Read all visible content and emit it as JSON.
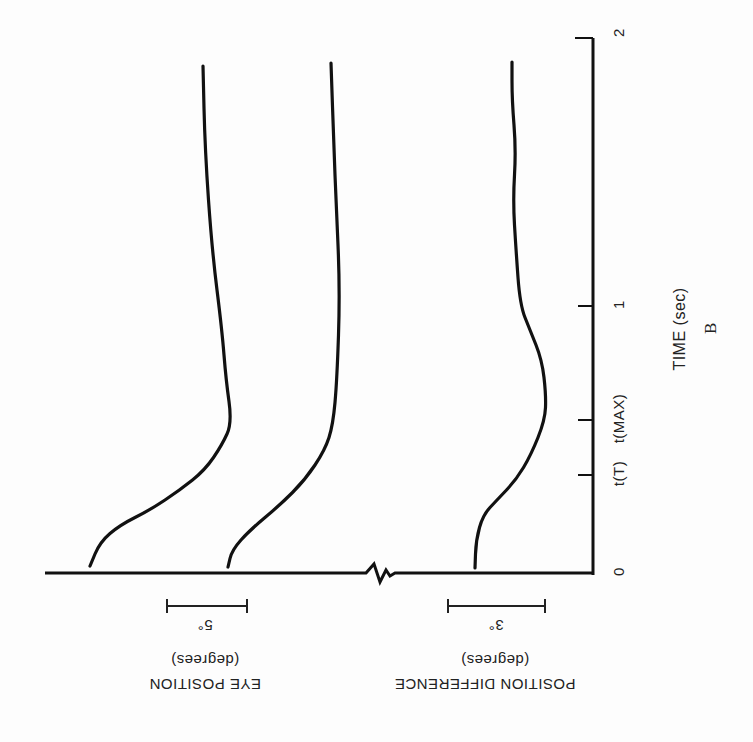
{
  "chart_data": {
    "type": "line",
    "panel_label": "B",
    "orientation_note": "figure is printed rotated: time axis runs vertically on right, traces drawn as near-vertical curves; left labels upside-down",
    "x_axis": {
      "label": "TIME (sec)",
      "range": [
        0,
        2
      ],
      "ticks": [
        {
          "value": 0,
          "label": "0"
        },
        {
          "value": 0.37,
          "label": "t(T)"
        },
        {
          "value": 0.57,
          "label": "t(MAX)"
        },
        {
          "value": 1,
          "label": "1"
        },
        {
          "value": 2,
          "label": "2"
        }
      ]
    },
    "y_axes": [
      {
        "label": "EYE POSITION",
        "unit": "(degrees)",
        "scale_bar": "5°"
      },
      {
        "label": "POSITION DIFFERENCE",
        "unit": "(degrees)",
        "scale_bar": "3°"
      }
    ],
    "axis_break": true,
    "series": [
      {
        "name": "Eye position trace 1",
        "group": "EYE POSITION",
        "points_t_deg": [
          [
            0.03,
            0.0
          ],
          [
            0.12,
            0.9
          ],
          [
            0.18,
            2.5
          ],
          [
            0.3,
            5.6
          ],
          [
            0.39,
            7.2
          ],
          [
            0.48,
            8.3
          ],
          [
            0.56,
            8.9
          ],
          [
            0.9,
            7.8
          ],
          [
            1.2,
            6.7
          ],
          [
            1.6,
            6.0
          ],
          [
            1.89,
            7.0
          ]
        ]
      },
      {
        "name": "Eye position trace 2",
        "group": "EYE POSITION",
        "points_t_deg": [
          [
            0.02,
            0.0
          ],
          [
            0.09,
            0.3
          ],
          [
            0.16,
            1.4
          ],
          [
            0.25,
            3.3
          ],
          [
            0.35,
            4.8
          ],
          [
            0.46,
            6.1
          ],
          [
            0.55,
            6.6
          ],
          [
            0.8,
            6.8
          ],
          [
            1.1,
            6.9
          ],
          [
            1.5,
            6.7
          ],
          [
            1.9,
            6.4
          ]
        ]
      },
      {
        "name": "Position difference",
        "group": "POSITION DIFFERENCE",
        "points_t_deg": [
          [
            0.02,
            0.0
          ],
          [
            0.12,
            0.1
          ],
          [
            0.22,
            0.6
          ],
          [
            0.32,
            1.3
          ],
          [
            0.42,
            2.0
          ],
          [
            0.55,
            2.2
          ],
          [
            0.66,
            2.2
          ],
          [
            0.8,
            1.9
          ],
          [
            0.96,
            1.4
          ],
          [
            1.2,
            1.3
          ],
          [
            1.5,
            1.3
          ],
          [
            1.9,
            1.2
          ]
        ]
      }
    ]
  },
  "render": {
    "axis": {
      "x": 593,
      "y_top": 38,
      "y_bottom": 573,
      "h_left": 45
    },
    "ticks_y": [
      38,
      475,
      420,
      306
    ],
    "traces_px": [
      [
        [
          90,
          566
        ],
        [
          100,
          542
        ],
        [
          120,
          525
        ],
        [
          150,
          510
        ],
        [
          180,
          490
        ],
        [
          205,
          470
        ],
        [
          222,
          445
        ],
        [
          232,
          423
        ],
        [
          226,
          380
        ],
        [
          222,
          330
        ],
        [
          212,
          250
        ],
        [
          205,
          150
        ],
        [
          203,
          66
        ]
      ],
      [
        [
          228,
          567
        ],
        [
          232,
          550
        ],
        [
          250,
          530
        ],
        [
          280,
          505
        ],
        [
          305,
          480
        ],
        [
          325,
          450
        ],
        [
          333,
          425
        ],
        [
          337,
          380
        ],
        [
          340,
          290
        ],
        [
          336,
          200
        ],
        [
          334,
          150
        ],
        [
          331,
          63
        ]
      ],
      [
        [
          475,
          568
        ],
        [
          476,
          540
        ],
        [
          483,
          515
        ],
        [
          497,
          500
        ],
        [
          516,
          480
        ],
        [
          531,
          455
        ],
        [
          545,
          420
        ],
        [
          546,
          395
        ],
        [
          542,
          360
        ],
        [
          530,
          330
        ],
        [
          520,
          305
        ],
        [
          516,
          250
        ],
        [
          513,
          200
        ],
        [
          516,
          150
        ],
        [
          512,
          100
        ],
        [
          512,
          62
        ]
      ]
    ],
    "scalebars": [
      {
        "x1": 167,
        "x2": 247,
        "y": 606,
        "label": "5°",
        "label_x": 205
      },
      {
        "x1": 448,
        "x2": 545,
        "y": 606,
        "label": "3°",
        "label_x": 496
      }
    ]
  },
  "labels": {
    "tick_0": "0",
    "tick_tT": "t(T)",
    "tick_tMAX": "t(MAX)",
    "tick_1": "1",
    "tick_2": "2",
    "time_axis_title": "TIME (sec)",
    "panel_letter": "B",
    "eye_scale": "5°",
    "diff_scale": "3°",
    "eye_unit": "(degrees)",
    "eye_title": "EYE POSITION",
    "diff_unit": "(degrees)",
    "diff_title": "POSITION DIFFERENCE"
  }
}
